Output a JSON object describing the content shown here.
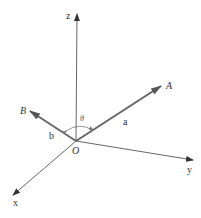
{
  "diagram": {
    "type": "3d-vector-axes",
    "origin_label": "O",
    "axes": [
      {
        "name": "z",
        "label": "z"
      },
      {
        "name": "y",
        "label": "y"
      },
      {
        "name": "x",
        "label": "x"
      }
    ],
    "vectors": [
      {
        "name": "A",
        "label": "A",
        "magnitude_label": "a"
      },
      {
        "name": "B",
        "label": "B",
        "magnitude_label": "b"
      }
    ],
    "angle_label": "θ",
    "colors": {
      "axis": "#444444",
      "vector": "#666666",
      "text": "#333333"
    }
  }
}
